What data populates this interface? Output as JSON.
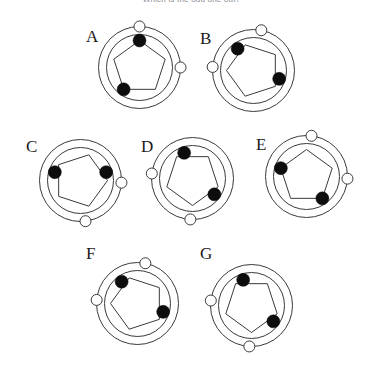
{
  "title": "Which is the odd one out?",
  "style": {
    "stroke": "#3a3a3a",
    "dot_fill": "#0d0d0d",
    "marker_fill": "#ffffff",
    "background": "#ffffff",
    "outer_radius": 41,
    "inner_radius": 33,
    "pentagon_radius": 27,
    "dot_radius": 6.5,
    "marker_radius": 5.5,
    "stroke_width": 1
  },
  "panels": [
    {
      "id": "A",
      "label": "A",
      "center": {
        "x": 139,
        "y": 67
      },
      "label_pos": {
        "x": 86,
        "y": 28
      },
      "pentagon_rotation_deg": 0,
      "pentagon_apex": "up",
      "dots": [
        {
          "name": "dot-apex",
          "angle_deg": 270
        },
        {
          "name": "dot-lower-left",
          "angle_deg": 126
        }
      ],
      "markers": [
        {
          "name": "marker-top",
          "angle_deg": 270
        },
        {
          "name": "marker-right",
          "angle_deg": 0
        }
      ]
    },
    {
      "id": "B",
      "label": "B",
      "center": {
        "x": 253,
        "y": 70
      },
      "label_pos": {
        "x": 200,
        "y": 30
      },
      "pentagon_rotation_deg": 270,
      "pentagon_apex": "left",
      "dots": [
        {
          "name": "dot-upper-left",
          "angle_deg": 234
        },
        {
          "name": "dot-lower-right",
          "angle_deg": 18
        }
      ],
      "markers": [
        {
          "name": "marker-top",
          "angle_deg": 281
        },
        {
          "name": "marker-left",
          "angle_deg": 185
        }
      ]
    },
    {
      "id": "C",
      "label": "C",
      "center": {
        "x": 80,
        "y": 180
      },
      "label_pos": {
        "x": 26,
        "y": 138
      },
      "pentagon_rotation_deg": 90,
      "pentagon_apex": "right",
      "dots": [
        {
          "name": "dot-upper-left",
          "angle_deg": 198
        },
        {
          "name": "dot-right",
          "angle_deg": 342
        }
      ],
      "markers": [
        {
          "name": "marker-right",
          "angle_deg": 3
        },
        {
          "name": "marker-bottom",
          "angle_deg": 83
        }
      ]
    },
    {
      "id": "D",
      "label": "D",
      "center": {
        "x": 192,
        "y": 178
      },
      "label_pos": {
        "x": 141,
        "y": 138
      },
      "pentagon_rotation_deg": 180,
      "pentagon_apex": "down",
      "dots": [
        {
          "name": "dot-upper-left",
          "angle_deg": 252
        },
        {
          "name": "dot-lower-right",
          "angle_deg": 36
        }
      ],
      "markers": [
        {
          "name": "marker-left",
          "angle_deg": 187
        },
        {
          "name": "marker-bottom",
          "angle_deg": 93
        }
      ]
    },
    {
      "id": "E",
      "label": "E",
      "center": {
        "x": 306,
        "y": 176
      },
      "label_pos": {
        "x": 256,
        "y": 136
      },
      "pentagon_rotation_deg": 0,
      "pentagon_apex": "up",
      "dots": [
        {
          "name": "dot-upper-left",
          "angle_deg": 198
        },
        {
          "name": "dot-lower-right",
          "angle_deg": 54
        }
      ],
      "markers": [
        {
          "name": "marker-top",
          "angle_deg": 277
        },
        {
          "name": "marker-right",
          "angle_deg": 3
        }
      ]
    },
    {
      "id": "F",
      "label": "F",
      "center": {
        "x": 137,
        "y": 303
      },
      "label_pos": {
        "x": 86,
        "y": 245
      },
      "pentagon_rotation_deg": 270,
      "pentagon_apex": "left",
      "dots": [
        {
          "name": "dot-upper-left",
          "angle_deg": 234
        },
        {
          "name": "dot-lower-right",
          "angle_deg": 18
        }
      ],
      "markers": [
        {
          "name": "marker-top",
          "angle_deg": 281
        },
        {
          "name": "marker-left",
          "angle_deg": 185
        }
      ]
    },
    {
      "id": "G",
      "label": "G",
      "center": {
        "x": 251,
        "y": 305
      },
      "label_pos": {
        "x": 200,
        "y": 245
      },
      "pentagon_rotation_deg": 180,
      "pentagon_apex": "down",
      "dots": [
        {
          "name": "dot-upper-left",
          "angle_deg": 252
        },
        {
          "name": "dot-lower-right",
          "angle_deg": 36
        }
      ],
      "markers": [
        {
          "name": "marker-left",
          "angle_deg": 187
        },
        {
          "name": "marker-bottom",
          "angle_deg": 93
        }
      ]
    }
  ]
}
